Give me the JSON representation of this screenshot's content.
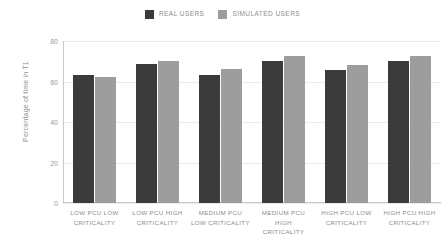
{
  "chart_data": {
    "type": "bar",
    "title": "",
    "subtitle": "",
    "xlabel": "",
    "ylabel": "Percentage of time in T1",
    "ylim": [
      0,
      80
    ],
    "yticks": [
      0,
      20,
      40,
      60,
      80
    ],
    "grid": true,
    "legend_position": "top-center",
    "categories": [
      "LOW PCU LOW CRITICALITY",
      "LOW PCU HIGH CRITICALITY",
      "MEDIUM PCU LOW CRITICALITY",
      "MEDIUM PCU HIGH CRITICALITY",
      "HIGH PCU LOW CRITICALITY",
      "HIGH PCU HIGH CRITICALITY"
    ],
    "category_lines": [
      [
        "LOW PCU LOW",
        "CRITICALITY"
      ],
      [
        "LOW PCU HIGH",
        "CRITICALITY"
      ],
      [
        "MEDIUM PCU",
        "LOW CRITICALITY"
      ],
      [
        "MEDIUM PCU",
        "HIGH",
        "CRITICALITY"
      ],
      [
        "HIGH PCU LOW",
        "CRITICALITY"
      ],
      [
        "HIGH PCU HIGH",
        "CRITICALITY"
      ]
    ],
    "series": [
      {
        "name": "REAL USERS",
        "color": "#3b3b3b",
        "values": [
          63,
          68.5,
          63,
          70,
          65.5,
          70
        ]
      },
      {
        "name": "SIMULATED USERS",
        "color": "#9d9d9d",
        "values": [
          62,
          70,
          66,
          72.5,
          68,
          72.5
        ]
      }
    ]
  },
  "legend": {
    "entries": [
      {
        "label": "REAL USERS",
        "color": "#3b3b3b",
        "swatch_icon": "square-swatch-icon"
      },
      {
        "label": "SIMULATED USERS",
        "color": "#9d9d9d",
        "swatch_icon": "square-swatch-icon"
      }
    ]
  },
  "axes": {
    "y_title": "Percentage of time in T1",
    "y_tick_labels": [
      "80",
      "60",
      "40",
      "20",
      "0"
    ]
  },
  "colors": {
    "background": "#ffffff",
    "gridline": "#ebebeb",
    "axis": "#c9c9c9",
    "text": "#8d8d8d",
    "series_real": "#3b3b3b",
    "series_simulated": "#9d9d9d"
  }
}
